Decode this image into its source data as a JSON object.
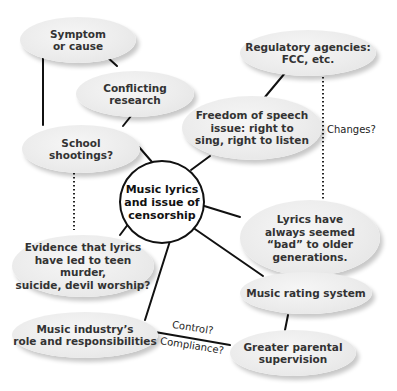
{
  "diagram": {
    "type": "cluster-map",
    "center": {
      "id": "center",
      "label": "Music lyrics\nand issue of\ncensorship"
    },
    "nodes": [
      {
        "id": "symptom",
        "label": "Symptom\nor cause"
      },
      {
        "id": "conflicting",
        "label": "Conflicting\nresearch"
      },
      {
        "id": "school",
        "label": "School\nshootings?"
      },
      {
        "id": "regulatory",
        "label": "Regulatory agencies:\nFCC, etc."
      },
      {
        "id": "freedom",
        "label": "Freedom of speech\nissue: right to\nsing, right to listen"
      },
      {
        "id": "lyrics_bad",
        "label": "Lyrics have\nalways seemed\n“bad” to older\ngenerations."
      },
      {
        "id": "evidence",
        "label": "Evidence that lyrics\nhave led to teen murder,\nsuicide, devil worship?"
      },
      {
        "id": "rating",
        "label": "Music rating system"
      },
      {
        "id": "industry",
        "label": "Music industry’s\nrole and responsibilities"
      },
      {
        "id": "parental",
        "label": "Greater parental\nsupervision"
      }
    ],
    "edge_labels": {
      "changes": "Changes?",
      "control": "Control?",
      "compliance": "Compliance?"
    },
    "edges": [
      {
        "from": "symptom",
        "to": "conflicting",
        "style": "solid"
      },
      {
        "from": "symptom",
        "to": "school",
        "style": "solid"
      },
      {
        "from": "conflicting",
        "to": "school",
        "style": "solid"
      },
      {
        "from": "school",
        "to": "center",
        "style": "solid"
      },
      {
        "from": "school",
        "to": "evidence",
        "style": "dotted"
      },
      {
        "from": "regulatory",
        "to": "freedom",
        "style": "solid"
      },
      {
        "from": "regulatory",
        "to": "lyrics_bad",
        "style": "dotted",
        "label": "Changes?"
      },
      {
        "from": "freedom",
        "to": "center",
        "style": "solid"
      },
      {
        "from": "center",
        "to": "lyrics_bad",
        "style": "solid"
      },
      {
        "from": "center",
        "to": "evidence",
        "style": "solid"
      },
      {
        "from": "center",
        "to": "rating",
        "style": "solid"
      },
      {
        "from": "center",
        "to": "industry",
        "style": "solid"
      },
      {
        "from": "rating",
        "to": "parental",
        "style": "solid"
      },
      {
        "from": "industry",
        "to": "parental",
        "style": "solid",
        "label": "Control? / Compliance?"
      }
    ]
  }
}
